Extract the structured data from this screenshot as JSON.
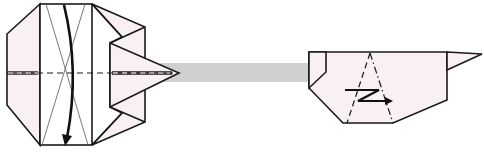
{
  "diagram": {
    "type": "origami-step",
    "colors": {
      "paper_fill": "#f9f0f3",
      "transition_band": "#d0d0d0",
      "line": "#1a1a1a",
      "background": "#ffffff"
    },
    "figures": [
      {
        "id": "before",
        "description": "Octagonal folded model with pointed flap on the right, horizontal valley-fold centre line, X-shaped reference creases, and curved arrow indicating a fold toward the viewer from top to bottom",
        "symbols": [
          "valley-fold-line",
          "reference-creases-x",
          "curved-fold-arrow"
        ]
      },
      {
        "id": "after",
        "description": "Resulting folded shape (side view) with small flap at upper-left, spike pointing right, valley-fold and mountain-fold lines forming a triangle, and a pleat/zigzag (crimp) arrow",
        "symbols": [
          "valley-fold-line",
          "mountain-fold-line",
          "pleat-arrow"
        ]
      }
    ],
    "transition": {
      "description": "Grey band connecting the two figures, indicating the result of the step"
    }
  }
}
